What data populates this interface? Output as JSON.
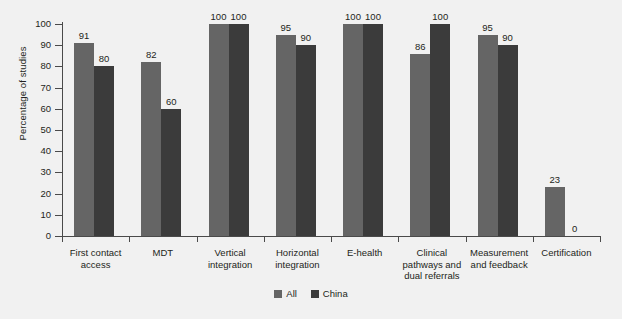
{
  "chart_data": {
    "type": "bar",
    "title": "",
    "xlabel": "",
    "ylabel": "Percentage of studies",
    "ylim": [
      0,
      100
    ],
    "ytick_step": 10,
    "yticks": [
      100,
      90,
      80,
      70,
      60,
      50,
      40,
      30,
      20,
      10,
      0
    ],
    "grid": false,
    "legend_position": "bottom-center",
    "categories": [
      "First contact access",
      "MDT",
      "Vertical integration",
      "Horizontal integration",
      "E-health",
      "Clinical pathways and dual referrals",
      "Measurement and feedback",
      "Certification"
    ],
    "category_lines": [
      [
        "First contact",
        "access"
      ],
      [
        "MDT"
      ],
      [
        "Vertical",
        "integration"
      ],
      [
        "Horizontal",
        "integration"
      ],
      [
        "E-health"
      ],
      [
        "Clinical",
        "pathways and",
        "dual referrals"
      ],
      [
        "Measurement",
        "and feedback"
      ],
      [
        "Certification"
      ]
    ],
    "series": [
      {
        "name": "All",
        "color": "#656565",
        "values": [
          91,
          82,
          100,
          95,
          100,
          86,
          95,
          23
        ],
        "labels": [
          "91",
          "82",
          "100",
          "95",
          "100",
          "86",
          "95",
          "23"
        ]
      },
      {
        "name": "China",
        "color": "#3b3b3b",
        "values": [
          80,
          60,
          100,
          90,
          100,
          100,
          90,
          0
        ],
        "labels": [
          "80",
          "60",
          "100",
          "90",
          "100",
          "100",
          "90",
          "0"
        ]
      }
    ]
  },
  "legend": {
    "items": [
      {
        "label": "All",
        "color": "#656565"
      },
      {
        "label": "China",
        "color": "#3b3b3b"
      }
    ]
  },
  "colors": {
    "background": "#f1f1f1",
    "axis": "#4a4a4a",
    "text": "#231f20",
    "series_all": "#656565",
    "series_china": "#3b3b3b"
  }
}
